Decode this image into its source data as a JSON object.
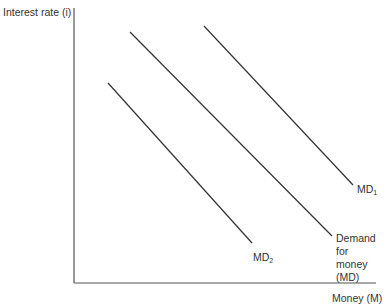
{
  "chart_data": {
    "type": "line",
    "title": "",
    "xlabel": "Money (M)",
    "ylabel": "Interest rate (i)",
    "grid": false,
    "legend": "inline labels at line ends",
    "series": [
      {
        "name": "MD1",
        "label_main": "MD",
        "label_sub": "1",
        "x1": 204,
        "y1": 26,
        "x2": 353,
        "y2": 185
      },
      {
        "name": "Demand for money (MD)",
        "label_line1": "Demand for",
        "label_line2": "money (MD)",
        "x1": 130,
        "y1": 32,
        "x2": 332,
        "y2": 236
      },
      {
        "name": "MD2",
        "label_main": "MD",
        "label_sub": "2",
        "x1": 108,
        "y1": 83,
        "x2": 252,
        "y2": 243
      }
    ],
    "axes": {
      "origin_x": 74,
      "origin_y": 283,
      "y_top": 8,
      "x_right": 376
    }
  },
  "colors": {
    "line": "#333333",
    "axis": "#555555"
  }
}
